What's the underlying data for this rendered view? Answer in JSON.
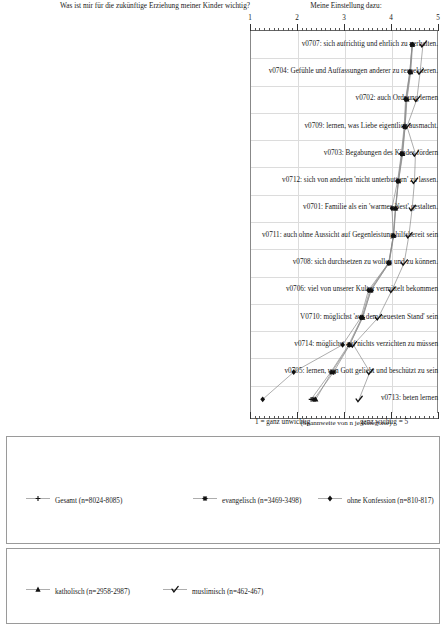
{
  "header": {
    "left_title": "Was ist mir für die zukünftige Erziehung meiner Kinder wichtig?",
    "right_title": "Meine Einstellung dazu:"
  },
  "axis": {
    "ticks": [
      "1",
      "2",
      "3",
      "4",
      "5"
    ],
    "tick_values": [
      1,
      2,
      3,
      4,
      5
    ],
    "left_caption": "1 = ganz unwichtig",
    "right_caption": "ganz wichtig = 5",
    "range_note": "(Spannweite von n je Kategorie)"
  },
  "legend": {
    "row1": [
      {
        "label": "Gesamt (n=8024-8085)",
        "marker": "plus",
        "name": "gesamt"
      },
      {
        "label": "evangelisch (n=3469-3498)",
        "marker": "star",
        "name": "evangelisch"
      },
      {
        "label": "ohne Konfession (n=810-817)",
        "marker": "diamond",
        "name": "ohne-konfession"
      }
    ],
    "row2": [
      {
        "label": "katholisch (n=2958-2987)",
        "marker": "triangle",
        "name": "katholisch"
      },
      {
        "label": "muslimisch (n=462-467)",
        "marker": "check",
        "name": "muslimisch"
      }
    ]
  },
  "chart_data": {
    "type": "line",
    "orientation": "horizontal",
    "title": "Was ist mir für die zukünftige Erziehung meiner Kinder wichtig?",
    "xlabel": "Meine Einstellung dazu:",
    "ylabel": "",
    "xlim": [
      1,
      5
    ],
    "grid": true,
    "legend_position": "bottom",
    "categories": [
      "v0707: sich aufrichtig und ehrlich zu verhalten.",
      "v0704: Gefühle und Auffassungen anderer zu respektieren.",
      "v0702: auch Ordnung lernen",
      "v0709: lernen, was Liebe eigentlich ausmacht.",
      "v0703: Begabungen des Kindes fördern",
      "v0712: sich von anderen 'nicht unterbuttern' zu lassen.",
      "v0701: Familie als ein 'warmes Nest' gestalten.",
      "v0711: auch ohne Aussicht auf Gegenleistung hilfsbereit sein",
      "v0708: sich durchsetzen zu wollen und zu können.",
      "v0706: viel von unserer Kultur vermittelt bekommen",
      "V0710: möglichst 'auf dem neuesten Stand' sein",
      "v0714: möglichst auf nichts verzichten zu müssen",
      "v0705: lernen, von Gott geliebt und beschützt zu sein",
      "v0713: beten lernen"
    ],
    "series": [
      {
        "name": "Gesamt (n=8024-8085)",
        "marker": "plus",
        "values": [
          4.45,
          4.4,
          4.32,
          4.29,
          4.23,
          4.15,
          4.1,
          4.05,
          3.95,
          3.55,
          3.38,
          3.1,
          2.72,
          2.3
        ]
      },
      {
        "name": "evangelisch (n=3469-3498)",
        "marker": "star",
        "values": [
          4.45,
          4.41,
          4.33,
          4.3,
          4.24,
          4.16,
          4.09,
          4.05,
          3.96,
          3.58,
          3.39,
          3.12,
          2.78,
          2.36
        ]
      },
      {
        "name": "ohne Konfession (n=810-817)",
        "marker": "diamond",
        "values": [
          4.45,
          4.4,
          4.31,
          4.28,
          4.22,
          4.14,
          4.02,
          4.05,
          3.95,
          3.52,
          3.36,
          2.97,
          1.93,
          1.27
        ]
      },
      {
        "name": "katholisch (n=2958-2987)",
        "marker": "triangle",
        "values": [
          4.46,
          4.42,
          4.34,
          4.3,
          4.25,
          4.16,
          4.1,
          4.06,
          3.96,
          3.57,
          3.4,
          3.12,
          2.74,
          2.4
        ]
      },
      {
        "name": "muslimisch (n=462-467)",
        "marker": "check",
        "values": [
          4.68,
          4.62,
          4.55,
          4.34,
          4.52,
          4.5,
          4.45,
          4.38,
          4.28,
          4.02,
          3.73,
          3.2,
          3.55,
          3.32
        ]
      }
    ]
  }
}
